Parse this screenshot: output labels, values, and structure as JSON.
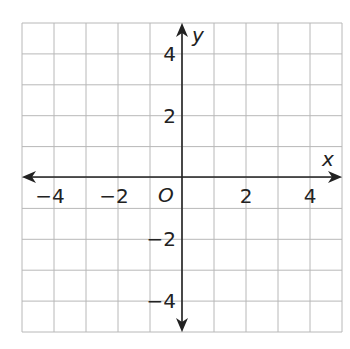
{
  "chart_data": {
    "type": "coordinate-grid",
    "title": "",
    "xlabel": "x",
    "ylabel": "y",
    "origin_label": "O",
    "xlim": [
      -5,
      5
    ],
    "ylim": [
      -5,
      5
    ],
    "grid": true,
    "grid_step": 1,
    "x_ticks": [
      -4,
      -2,
      2,
      4
    ],
    "y_ticks": [
      4,
      2,
      -2,
      -4
    ],
    "x_tick_labels": [
      "−4",
      "−2",
      "2",
      "4"
    ],
    "y_tick_labels": [
      "4",
      "2",
      "−2",
      "−4"
    ],
    "series": []
  },
  "colors": {
    "grid": "#b8b8b8",
    "axis": "#222222",
    "background": "#ffffff"
  }
}
